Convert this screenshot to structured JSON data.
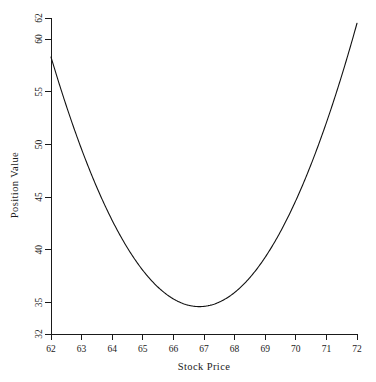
{
  "chart_data": {
    "type": "line",
    "title": "",
    "subtitle": "",
    "xlabel": "Stock Price",
    "ylabel": "Position Value",
    "xlim": [
      62,
      72
    ],
    "ylim": [
      32,
      62
    ],
    "grid": false,
    "legend": null,
    "legend_position": "none",
    "line_color": "#111111",
    "background_color": "#ffffff",
    "axis_color": "#1a1a1a",
    "x_ticks": [
      62,
      63,
      64,
      65,
      66,
      67,
      68,
      69,
      70,
      71,
      72
    ],
    "x_tick_labels": [
      "62",
      "63",
      "64",
      "65",
      "66",
      "67",
      "68",
      "69",
      "70",
      "71",
      "72"
    ],
    "y_ticks": [
      32,
      35,
      40,
      45,
      50,
      55,
      60,
      62
    ],
    "y_tick_labels": [
      "32",
      "35",
      "40",
      "45",
      "50",
      "55",
      "60",
      "62"
    ],
    "series": [
      {
        "name": "Position Value",
        "x": [
          62.0,
          62.25,
          62.5,
          62.75,
          63.0,
          63.25,
          63.5,
          63.75,
          64.0,
          64.25,
          64.5,
          64.75,
          65.0,
          65.25,
          65.5,
          65.75,
          66.0,
          66.25,
          66.5,
          66.75,
          66.85,
          67.0,
          67.25,
          67.5,
          67.75,
          68.0,
          68.25,
          68.5,
          68.75,
          69.0,
          69.25,
          69.5,
          69.75,
          70.0,
          70.25,
          70.5,
          70.75,
          71.0,
          71.25,
          71.5,
          71.75,
          72.0
        ],
        "y": [
          58.3,
          57.05,
          55.84,
          54.67,
          53.53,
          52.44,
          51.38,
          50.37,
          49.39,
          48.45,
          47.56,
          46.7,
          45.88,
          45.11,
          44.37,
          43.68,
          43.02,
          42.41,
          41.84,
          41.31,
          41.15,
          40.82,
          40.37,
          39.96,
          39.6,
          39.27,
          38.99,
          38.75,
          38.55,
          38.39,
          38.27,
          38.2,
          38.16,
          38.17,
          38.22,
          38.31,
          38.44,
          38.61,
          38.83,
          39.08,
          39.38,
          39.71
        ]
      }
    ],
    "annotations": []
  },
  "curve_points": {
    "description": "Sampled points of the plotted convex curve in data coordinates (stock price, position value).",
    "points": [
      [
        62.0,
        58.3
      ],
      [
        62.2,
        57.28
      ],
      [
        62.4,
        56.29
      ],
      [
        62.6,
        55.31
      ],
      [
        62.8,
        54.36
      ],
      [
        63.0,
        53.43
      ],
      [
        63.2,
        52.52
      ],
      [
        63.4,
        51.63
      ],
      [
        63.6,
        50.76
      ],
      [
        63.8,
        49.92
      ],
      [
        64.0,
        49.1
      ],
      [
        64.2,
        48.3
      ],
      [
        64.4,
        47.52
      ],
      [
        64.6,
        46.77
      ],
      [
        64.8,
        46.04
      ],
      [
        65.0,
        45.33
      ],
      [
        65.2,
        44.65
      ],
      [
        65.4,
        43.99
      ],
      [
        65.6,
        43.36
      ],
      [
        65.8,
        42.76
      ],
      [
        66.0,
        42.18
      ],
      [
        66.2,
        41.63
      ],
      [
        66.4,
        41.12
      ],
      [
        66.6,
        40.64
      ],
      [
        66.8,
        40.19
      ],
      [
        67.0,
        39.78
      ],
      [
        67.2,
        39.41
      ],
      [
        67.4,
        39.08
      ],
      [
        67.6,
        38.79
      ],
      [
        67.8,
        38.54
      ],
      [
        68.0,
        38.34
      ],
      [
        68.2,
        38.19
      ],
      [
        68.4,
        38.08
      ],
      [
        68.6,
        38.02
      ],
      [
        68.8,
        38.02
      ],
      [
        69.0,
        38.06
      ],
      [
        69.2,
        38.16
      ],
      [
        69.4,
        38.31
      ],
      [
        69.6,
        38.52
      ],
      [
        69.8,
        38.78
      ],
      [
        70.0,
        39.1
      ],
      [
        70.2,
        39.47
      ],
      [
        70.4,
        39.9
      ],
      [
        70.6,
        40.39
      ],
      [
        70.8,
        40.93
      ],
      [
        71.0,
        41.53
      ],
      [
        71.2,
        42.19
      ],
      [
        71.4,
        42.9
      ],
      [
        71.6,
        43.67
      ],
      [
        71.8,
        44.5
      ],
      [
        72.0,
        45.38
      ]
    ]
  },
  "axes": {
    "x_axis_label": "Stock Price",
    "y_axis_label": "Position Value"
  }
}
